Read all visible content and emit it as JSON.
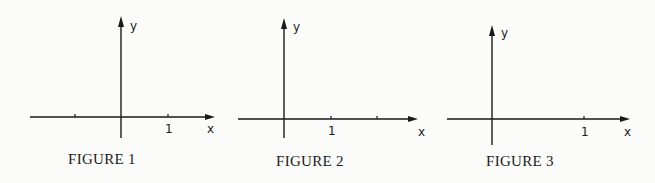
{
  "figures": [
    {
      "caption": "FIGURE 1",
      "x_axis_label": "x",
      "y_axis_label": "y",
      "tick_label": "1",
      "origin": [
        121,
        117
      ],
      "x_axis_range_px": [
        30,
        214
      ],
      "y_axis_range_px": [
        16,
        138
      ],
      "ticks_px": [
        75,
        168
      ],
      "labeled_tick_px": 168
    },
    {
      "caption": "FIGURE 2",
      "x_axis_label": "x",
      "y_axis_label": "y",
      "tick_label": "1",
      "origin": [
        284,
        119
      ],
      "x_axis_range_px": [
        238,
        418
      ],
      "y_axis_range_px": [
        18,
        138
      ],
      "ticks_px": [
        331,
        377
      ],
      "labeled_tick_px": 331
    },
    {
      "caption": "FIGURE 3",
      "x_axis_label": "x",
      "y_axis_label": "y",
      "tick_label": "1",
      "origin": [
        492,
        119
      ],
      "x_axis_range_px": [
        447,
        630
      ],
      "y_axis_range_px": [
        25,
        145
      ],
      "ticks_px": [
        584
      ],
      "labeled_tick_px": 584
    }
  ]
}
